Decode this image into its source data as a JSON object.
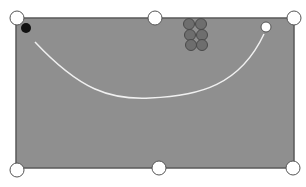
{
  "diagram": {
    "type": "billiards-table-shot",
    "table": {
      "x": 16,
      "y": 18,
      "width": 278,
      "height": 178,
      "felt_color": "#8f8f8f",
      "border_color": "#5a5a5a"
    },
    "pockets": [
      {
        "name": "top-left",
        "cx": 17,
        "cy": 18
      },
      {
        "name": "top-middle",
        "cx": 155,
        "cy": 18
      },
      {
        "name": "top-right-pocket",
        "cx": 294,
        "cy": 18
      },
      {
        "name": "bottom-left",
        "cx": 17,
        "cy": 170
      },
      {
        "name": "bottom-middle",
        "cx": 159,
        "cy": 168
      },
      {
        "name": "bottom-right",
        "cx": 293,
        "cy": 168
      }
    ],
    "object_ball_black": {
      "cx": 26,
      "cy": 28,
      "r": 5,
      "color": "#111111"
    },
    "cue_ball": {
      "cx": 266,
      "cy": 27,
      "r": 5,
      "color": "#ffffff"
    },
    "rack_balls": [
      {
        "cx": 189,
        "cy": 24
      },
      {
        "cx": 201,
        "cy": 24
      },
      {
        "cx": 190,
        "cy": 35
      },
      {
        "cx": 202,
        "cy": 35
      },
      {
        "cx": 191,
        "cy": 45
      },
      {
        "cx": 202,
        "cy": 45
      }
    ],
    "rack_ball_color": "#6e6e6e",
    "path": {
      "d": "M35 42 C 80 90, 110 100, 150 98 C 200 96, 240 85, 264 34",
      "color": "#f0f0f0"
    }
  }
}
